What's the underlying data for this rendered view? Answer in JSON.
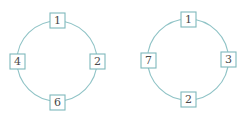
{
  "colors": {
    "ring": "#8fc3c6",
    "box_border": "#7fb8bc",
    "text": "#4a4a4a",
    "background": "#ffffff"
  },
  "diagrams": [
    {
      "name": "left-ring",
      "center": [
        57,
        61
      ],
      "radius": 40,
      "nodes": [
        {
          "position": "top",
          "label": "1"
        },
        {
          "position": "right",
          "label": "2"
        },
        {
          "position": "bottom",
          "label": "6"
        },
        {
          "position": "left",
          "label": "4"
        }
      ]
    },
    {
      "name": "right-ring",
      "center": [
        188,
        59
      ],
      "radius": 40,
      "nodes": [
        {
          "position": "top",
          "label": "1"
        },
        {
          "position": "right",
          "label": "3"
        },
        {
          "position": "bottom",
          "label": "2"
        },
        {
          "position": "left",
          "label": "7"
        }
      ]
    }
  ]
}
